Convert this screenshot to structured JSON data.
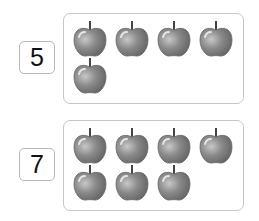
{
  "groups": [
    {
      "number": "5",
      "apple_count": 5
    },
    {
      "number": "7",
      "apple_count": 7
    }
  ],
  "colors": {
    "apple_fill": "#8a8a8a",
    "apple_highlight": "#c8c8c8",
    "stem": "#444444",
    "box_border": "#c6c6c6"
  },
  "icons": {
    "apple": "apple-icon"
  }
}
